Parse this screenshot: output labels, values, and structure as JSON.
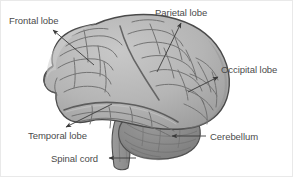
{
  "figure": {
    "type": "anatomical-diagram",
    "background_color": "#ffffff",
    "text_color": "#4b4b4b",
    "border_color": "#e9e9e9",
    "palette": {
      "cortex_fill": "#b3b3b3",
      "cortex_light": "#c6c6c6",
      "cortex_shadow": "#9a9a9a",
      "sulcus_line": "#6e6e6e",
      "outline": "#4a4a4a",
      "cerebellum_fill": "#8d8d8d",
      "cerebellum_shadow": "#7a7a7a",
      "brainstem_fill": "#8a8a8a",
      "arrow_color": "#3a3a3a"
    },
    "labels": [
      {
        "id": "frontal-lobe",
        "text": "Frontal lobe",
        "x": 9,
        "y": 15,
        "arrow_from": [
          52,
          30
        ],
        "arrow_to": [
          94,
          65
        ]
      },
      {
        "id": "parietal-lobe",
        "text": "Parietal lobe",
        "x": 155,
        "y": 7,
        "arrow_from": [
          182,
          22
        ],
        "arrow_to": [
          157,
          72
        ]
      },
      {
        "id": "occipital-lobe",
        "text": "Occipital lobe",
        "x": 221,
        "y": 64,
        "arrow_from": [
          219,
          76
        ],
        "arrow_to": [
          188,
          92
        ]
      },
      {
        "id": "temporal-lobe",
        "text": "Temporal lobe",
        "x": 28,
        "y": 130,
        "arrow_from": [
          65,
          128
        ],
        "arrow_to": [
          112,
          104
        ]
      },
      {
        "id": "cerebellum",
        "text": "Cerebellum",
        "x": 210,
        "y": 131,
        "arrow_from": [
          206,
          136
        ],
        "arrow_to": [
          170,
          136
        ]
      },
      {
        "id": "spinal-cord",
        "text": "Spinal cord",
        "x": 51,
        "y": 153,
        "arrow_from": [
          108,
          158
        ],
        "arrow_to": [
          133,
          158
        ]
      }
    ]
  }
}
